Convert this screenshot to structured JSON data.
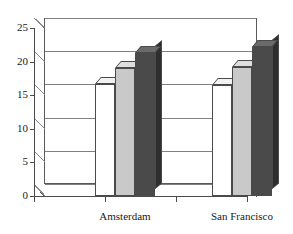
{
  "chart_data": {
    "type": "bar",
    "title": "",
    "subtitle": "",
    "xlabel": "",
    "ylabel": "",
    "categories": [
      "Amsterdam",
      "San Francisco"
    ],
    "yticks": [
      0,
      5,
      10,
      15,
      20,
      25
    ],
    "ylim": [
      0,
      25
    ],
    "grid": true,
    "legend": "none",
    "style": "3d-grouped-bar",
    "series": [
      {
        "name": "series-1",
        "color": "#ffffff",
        "values": [
          16.7,
          16.5
        ]
      },
      {
        "name": "series-2",
        "color": "#c9c9c9",
        "values": [
          19.1,
          19.2
        ]
      },
      {
        "name": "series-3",
        "color": "#4a4a4a",
        "values": [
          21.3,
          22.2
        ]
      }
    ]
  },
  "axis": {
    "y_tick_labels": [
      "25",
      "20",
      "15",
      "10",
      "5",
      "0"
    ],
    "x_tick_labels": [
      "Amsterdam",
      "San Francisco"
    ]
  },
  "colors": {
    "bar_white": "#ffffff",
    "bar_gray": "#c9c9c9",
    "bar_dark": "#4a4a4a",
    "bar_dark_side": "#2e2e2e",
    "bar_gray_side": "#a8a8a8",
    "bar_white_side": "#e8e8e8",
    "axis_line": "#4a4a4a",
    "grid_line": "#808080",
    "background": "#ffffff"
  }
}
